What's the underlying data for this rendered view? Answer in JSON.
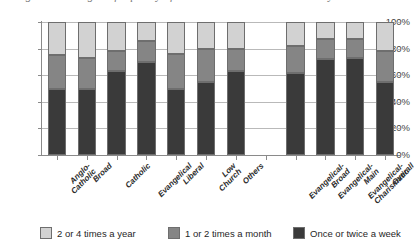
{
  "title_sliver": "Diagram showing the frequency of attendance at church services by churchmanship",
  "chart_data": {
    "type": "bar",
    "subtype": "stacked-vertical-100",
    "title": "",
    "xlabel": "",
    "ylabel": "",
    "ylim": [
      0,
      100
    ],
    "ytick_labels": [
      "0%",
      "20%",
      "40%",
      "60%",
      "80%",
      "100%"
    ],
    "ytick_values": [
      0,
      20,
      40,
      60,
      80,
      100
    ],
    "grid": true,
    "legend_position": "bottom",
    "categories": [
      "Anglo-Catholic",
      "Broad",
      "Catholic",
      "Evangelical",
      "Liberal",
      "Low Church",
      "Others",
      "Evangelical-Broad",
      "Evangelical-Main",
      "Evangelical-Charismatic",
      "Overall"
    ],
    "category_lines": [
      [
        "Anglo-",
        "Catholic"
      ],
      [
        "Broad"
      ],
      [
        "Catholic"
      ],
      [
        "Evangelical"
      ],
      [
        "Liberal"
      ],
      [
        "Low",
        "Church"
      ],
      [
        "Others"
      ],
      [
        "Evangelical-",
        "Broad"
      ],
      [
        "Evangelical-",
        "Main"
      ],
      [
        "Evangelical-",
        "Charismatic"
      ],
      [
        "Overall"
      ]
    ],
    "group_gap_after_index": 6,
    "series": [
      {
        "name": "Once or twice a week",
        "color": "#3a3a3a",
        "values": [
          50,
          50,
          63,
          70,
          50,
          55,
          63,
          62,
          72,
          73,
          55
        ]
      },
      {
        "name": "1 or 2 times a month",
        "color": "#858585",
        "values": [
          25,
          23,
          15,
          16,
          26,
          25,
          17,
          20,
          15,
          14,
          23
        ]
      },
      {
        "name": "2 or 4 times a year",
        "color": "#d2d2d2",
        "values": [
          25,
          27,
          22,
          14,
          24,
          20,
          20,
          18,
          13,
          13,
          22
        ]
      }
    ]
  },
  "legend": {
    "items": [
      {
        "label": "2 or 4 times a year",
        "color": "#d2d2d2"
      },
      {
        "label": "1 or 2 times a month",
        "color": "#858585"
      },
      {
        "label": "Once or twice a week",
        "color": "#3a3a3a"
      }
    ]
  }
}
